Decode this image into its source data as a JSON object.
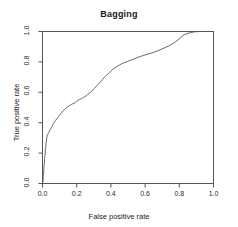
{
  "chart_data": {
    "type": "line",
    "title": "Bagging",
    "xlabel": "False positive rate",
    "ylabel": "True positive rate",
    "xlim": [
      0,
      1
    ],
    "ylim": [
      0,
      1
    ],
    "grid": false,
    "legend": null,
    "xticks": [
      "0.0",
      "0.2",
      "0.4",
      "0.6",
      "0.8",
      "1.0"
    ],
    "xtick_values": [
      0.0,
      0.2,
      0.4,
      0.6,
      0.8,
      1.0
    ],
    "yticks": [
      "0.0",
      "0.2",
      "0.4",
      "0.6",
      "0.8",
      "1.0"
    ],
    "ytick_values": [
      0.0,
      0.2,
      0.4,
      0.6,
      0.8,
      1.0
    ],
    "line_color": "#555555",
    "series": [
      {
        "name": "ROC curve",
        "x": [
          0.0,
          0.004,
          0.004,
          0.008,
          0.008,
          0.012,
          0.012,
          0.016,
          0.016,
          0.02,
          0.02,
          0.024,
          0.024,
          0.028,
          0.028,
          0.032,
          0.032,
          0.036,
          0.04,
          0.044,
          0.048,
          0.052,
          0.056,
          0.06,
          0.064,
          0.07,
          0.076,
          0.082,
          0.088,
          0.094,
          0.1,
          0.106,
          0.112,
          0.12,
          0.128,
          0.136,
          0.144,
          0.152,
          0.16,
          0.168,
          0.176,
          0.184,
          0.192,
          0.2,
          0.208,
          0.216,
          0.224,
          0.232,
          0.24,
          0.248,
          0.256,
          0.264,
          0.272,
          0.28,
          0.288,
          0.296,
          0.304,
          0.312,
          0.32,
          0.328,
          0.336,
          0.344,
          0.352,
          0.36,
          0.368,
          0.376,
          0.384,
          0.392,
          0.4,
          0.412,
          0.424,
          0.436,
          0.448,
          0.46,
          0.472,
          0.484,
          0.496,
          0.508,
          0.52,
          0.536,
          0.552,
          0.568,
          0.584,
          0.6,
          0.616,
          0.632,
          0.648,
          0.664,
          0.68,
          0.696,
          0.712,
          0.728,
          0.744,
          0.756,
          0.768,
          0.78,
          0.792,
          0.804,
          0.816,
          0.828,
          0.84,
          0.856,
          0.872,
          0.888,
          0.92,
          0.95,
          0.975,
          1.0
        ],
        "y": [
          0.0,
          0.02,
          0.055,
          0.085,
          0.11,
          0.14,
          0.165,
          0.195,
          0.215,
          0.24,
          0.265,
          0.285,
          0.3,
          0.31,
          0.318,
          0.322,
          0.33,
          0.334,
          0.344,
          0.352,
          0.36,
          0.368,
          0.376,
          0.386,
          0.396,
          0.404,
          0.414,
          0.424,
          0.432,
          0.44,
          0.45,
          0.458,
          0.468,
          0.478,
          0.486,
          0.494,
          0.502,
          0.508,
          0.514,
          0.52,
          0.524,
          0.528,
          0.534,
          0.54,
          0.548,
          0.552,
          0.556,
          0.56,
          0.566,
          0.572,
          0.578,
          0.586,
          0.594,
          0.6,
          0.608,
          0.616,
          0.626,
          0.636,
          0.646,
          0.656,
          0.666,
          0.676,
          0.686,
          0.696,
          0.706,
          0.714,
          0.722,
          0.73,
          0.74,
          0.752,
          0.762,
          0.77,
          0.778,
          0.786,
          0.792,
          0.798,
          0.802,
          0.808,
          0.812,
          0.82,
          0.828,
          0.834,
          0.84,
          0.846,
          0.852,
          0.856,
          0.862,
          0.868,
          0.876,
          0.884,
          0.892,
          0.9,
          0.908,
          0.916,
          0.924,
          0.934,
          0.944,
          0.956,
          0.968,
          0.978,
          0.984,
          0.99,
          0.994,
          0.998,
          1.0,
          1.0,
          1.0,
          1.0
        ]
      }
    ]
  }
}
